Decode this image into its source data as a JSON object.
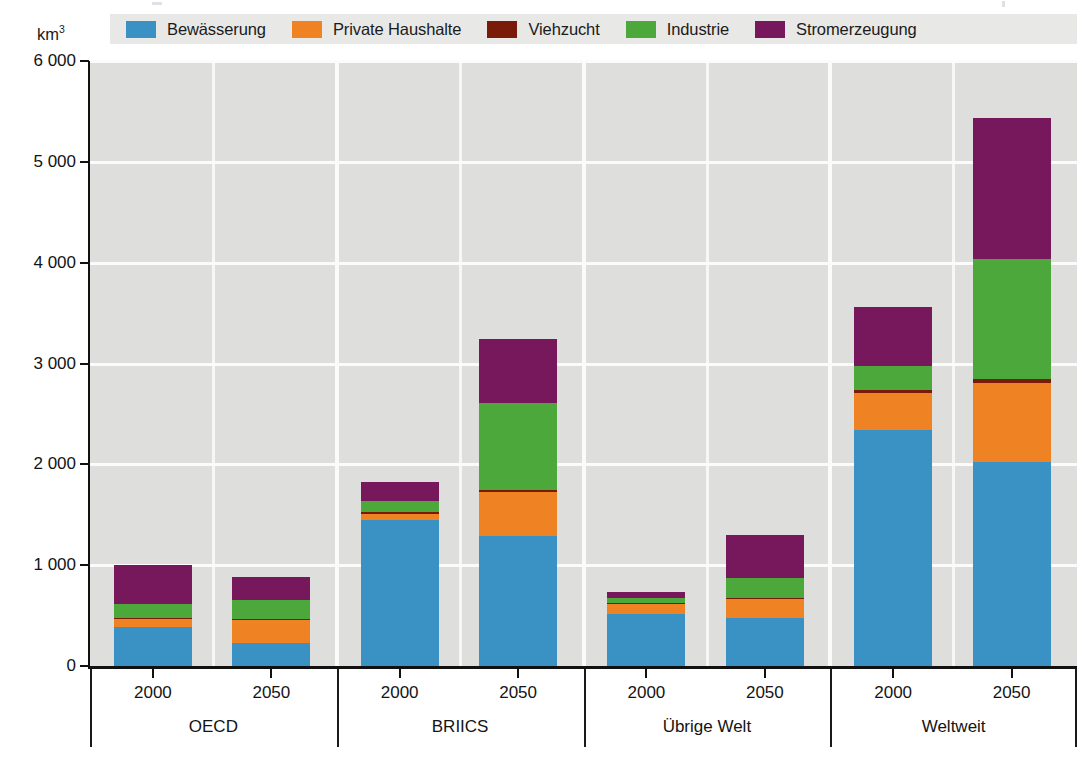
{
  "unit": {
    "text": "km",
    "exponent": "3"
  },
  "legend": {
    "items": [
      {
        "label": "Bewässerung",
        "color": "#3a92c4",
        "key": "irrigation"
      },
      {
        "label": "Private Haushalte",
        "color": "#ef8223",
        "key": "households"
      },
      {
        "label": "Viehzucht",
        "color": "#7a1a08",
        "key": "livestock"
      },
      {
        "label": "Industrie",
        "color": "#4da83c",
        "key": "industry"
      },
      {
        "label": "Stromerzeugung",
        "color": "#77175c",
        "key": "electricity"
      }
    ]
  },
  "chart_data": {
    "type": "bar",
    "stacked": true,
    "title": "",
    "xlabel": "",
    "ylabel": "km3",
    "ylim": [
      0,
      6000
    ],
    "yticks": [
      0,
      1000,
      2000,
      3000,
      4000,
      5000,
      6000
    ],
    "ytick_labels": [
      "0",
      "1 000",
      "2 000",
      "3 000",
      "4 000",
      "5 000",
      "6 000"
    ],
    "grid": true,
    "legend_position": "top",
    "groups": [
      "OECD",
      "BRIICS",
      "Übrige Welt",
      "Weltweit"
    ],
    "years": [
      "2000",
      "2050"
    ],
    "series": [
      {
        "name": "Bewässerung",
        "color": "#3a92c4",
        "values": [
          390,
          230,
          1450,
          1290,
          520,
          480,
          2340,
          2020
        ]
      },
      {
        "name": "Private Haushalte",
        "color": "#ef8223",
        "values": [
          80,
          230,
          60,
          440,
          90,
          180,
          370,
          790
        ]
      },
      {
        "name": "Viehzucht",
        "color": "#7a1a08",
        "values": [
          10,
          10,
          20,
          20,
          10,
          10,
          30,
          40
        ]
      },
      {
        "name": "Industrie",
        "color": "#4da83c",
        "values": [
          130,
          180,
          110,
          860,
          50,
          200,
          240,
          1190
        ]
      },
      {
        "name": "Stromerzeugung",
        "color": "#77175c",
        "values": [
          390,
          230,
          180,
          630,
          60,
          430,
          580,
          1390
        ]
      }
    ],
    "categories": [
      {
        "group": "OECD",
        "year": "2000",
        "total": 1000
      },
      {
        "group": "OECD",
        "year": "2050",
        "total": 880
      },
      {
        "group": "BRIICS",
        "year": "2000",
        "total": 1820
      },
      {
        "group": "BRIICS",
        "year": "2050",
        "total": 3240
      },
      {
        "group": "Übrige Welt",
        "year": "2000",
        "total": 730
      },
      {
        "group": "Übrige Welt",
        "year": "2050",
        "total": 1300
      },
      {
        "group": "Weltweit",
        "year": "2000",
        "total": 3560
      },
      {
        "group": "Weltweit",
        "year": "2050",
        "total": 5430
      }
    ]
  },
  "colors": {
    "plot_background": "#dededc",
    "legend_background": "#e8e8e6",
    "gridline": "#fbfbfb",
    "axis": "#111111"
  }
}
